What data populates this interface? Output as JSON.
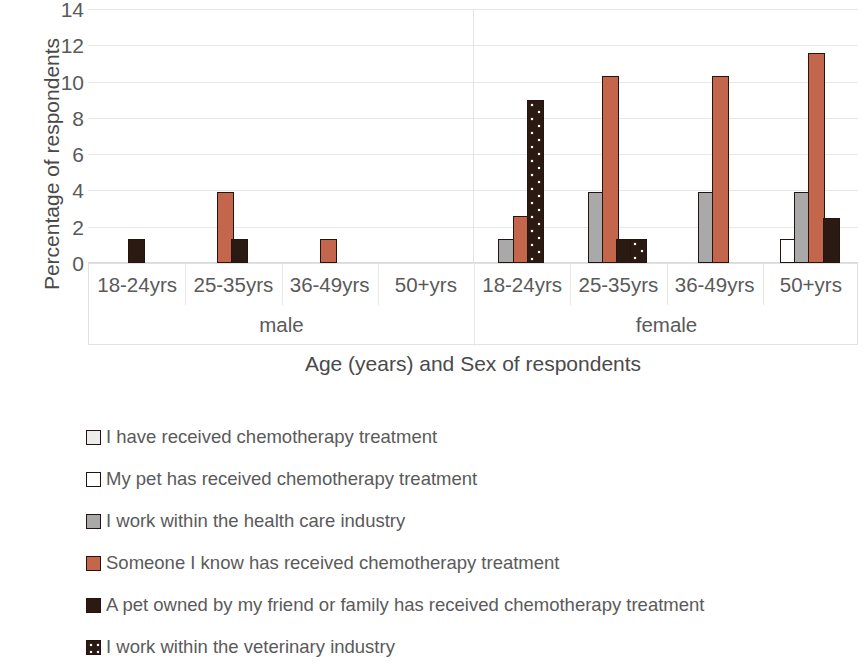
{
  "chart_data": {
    "type": "bar",
    "title": "",
    "xlabel": "Age (years) and Sex of respondents",
    "ylabel": "Percentage of respondents",
    "ylim": [
      0,
      14
    ],
    "yticks": [
      0,
      2,
      4,
      6,
      8,
      10,
      12,
      14
    ],
    "grid": true,
    "legend_position": "bottom-left",
    "groups": [
      {
        "sex": "male",
        "age": "18-24yrs"
      },
      {
        "sex": "male",
        "age": "25-35yrs"
      },
      {
        "sex": "male",
        "age": "36-49yrs"
      },
      {
        "sex": "male",
        "age": "50+yrs"
      },
      {
        "sex": "female",
        "age": "18-24yrs"
      },
      {
        "sex": "female",
        "age": "25-35yrs"
      },
      {
        "sex": "female",
        "age": "36-49yrs"
      },
      {
        "sex": "female",
        "age": "50+yrs"
      }
    ],
    "categories": [
      "male 18-24yrs",
      "male 25-35yrs",
      "male 36-49yrs",
      "male 50+yrs",
      "female 18-24yrs",
      "female 25-35yrs",
      "female 36-49yrs",
      "female 50+yrs"
    ],
    "super_categories": [
      "male",
      "female"
    ],
    "age_labels": [
      "18-24yrs",
      "25-35yrs",
      "36-49yrs",
      "50+yrs"
    ],
    "series": [
      {
        "name": "I have received chemotherapy treatment",
        "swatch": "dark-outline-swatch",
        "color": "#2b1a12",
        "values": [
          0,
          0,
          0,
          0,
          0,
          0,
          0,
          0
        ]
      },
      {
        "name": "My pet has received chemotherapy treatment",
        "swatch": "white-swatch",
        "color": "#ffffff",
        "values": [
          0,
          0,
          0,
          0,
          0,
          0,
          0,
          1.3
        ]
      },
      {
        "name": "I work within the health care industry",
        "swatch": "gray-swatch",
        "color": "#a9a9a9",
        "values": [
          0,
          0,
          0,
          0,
          1.3,
          3.9,
          3.9,
          3.9
        ]
      },
      {
        "name": "Someone I know has received chemotherapy treatment",
        "swatch": "orange-swatch",
        "color": "#c4664b",
        "values": [
          0,
          3.9,
          1.3,
          0,
          2.6,
          10.3,
          10.3,
          11.6
        ]
      },
      {
        "name": "A pet owned by my friend or family has received chemotherapy treatment",
        "swatch": "dark-solid-swatch",
        "color": "#2b1a12",
        "values": [
          1.3,
          1.3,
          0,
          0,
          0,
          1.3,
          0,
          2.5
        ]
      },
      {
        "name": "I work within the veterinary industry",
        "swatch": "dark-dotted-swatch",
        "color": "#2b1a12",
        "values": [
          0,
          0,
          0,
          0,
          9.0,
          1.3,
          0,
          0
        ]
      }
    ]
  }
}
